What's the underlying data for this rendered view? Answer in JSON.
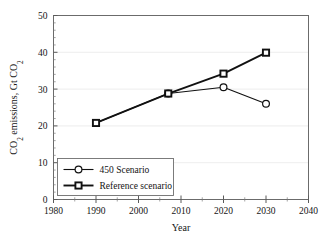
{
  "chart_data": {
    "type": "line",
    "title": "",
    "xlabel": "Year",
    "ylabel": "CO2 emissions, Gt CO2",
    "ylabel_parts": {
      "lead": "CO",
      "sub1": "2",
      "mid": " emissions, Gt CO",
      "sub2": "2"
    },
    "xlim": [
      1980,
      2040
    ],
    "ylim": [
      0,
      50
    ],
    "xticks": [
      1980,
      1990,
      2000,
      2010,
      2020,
      2030,
      2040
    ],
    "yticks": [
      0,
      10,
      20,
      30,
      40,
      50
    ],
    "xtick_labels": [
      "1980",
      "1990",
      "2000",
      "2010",
      "2020",
      "2030",
      "2040"
    ],
    "ytick_labels": [
      "0",
      "10",
      "20",
      "30",
      "40",
      "50"
    ],
    "x_minor_step": 5,
    "y_minor_step": 2,
    "grid": "horizontal",
    "legend_position": "lower-left",
    "series": [
      {
        "name": "450 Scenario",
        "marker": "circle-open",
        "line_width": "thin",
        "color": "#111111",
        "x": [
          1990,
          2007,
          2020,
          2030
        ],
        "values": [
          20.8,
          28.8,
          30.5,
          26.0
        ]
      },
      {
        "name": "Reference scenario",
        "marker": "square-open",
        "line_width": "thick",
        "color": "#111111",
        "x": [
          1990,
          2007,
          2020,
          2030
        ],
        "values": [
          20.8,
          28.8,
          34.2,
          39.9
        ]
      }
    ]
  },
  "legend": {
    "items": [
      {
        "label": "450 Scenario",
        "marker": "circle-open"
      },
      {
        "label": "Reference scenario",
        "marker": "square-open"
      }
    ]
  },
  "colors": {
    "foreground": "#111111",
    "axis": "#6b6b6b",
    "grid": "#e8e8e8",
    "background": "#ffffff"
  }
}
